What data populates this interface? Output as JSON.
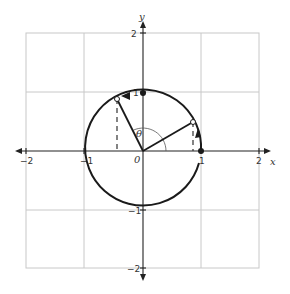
{
  "diagram": {
    "type": "unit-circle",
    "axes": {
      "x_label": "x",
      "y_label": "y",
      "x_ticks": [
        "−2",
        "−1",
        "1",
        "2"
      ],
      "y_ticks": [
        "2",
        "1",
        "−1",
        "−2"
      ],
      "origin_label": "0",
      "range": [
        -2,
        2
      ]
    },
    "angle_label": "θ",
    "circle_radius": 1,
    "points": [
      {
        "name": "point-on-x-axis",
        "x": 1,
        "y": 0,
        "style": "filled"
      },
      {
        "name": "point-on-y-axis",
        "x": 0,
        "y": 1,
        "style": "filled"
      },
      {
        "name": "point-q1",
        "angle_deg": 30,
        "style": "open"
      },
      {
        "name": "point-q2",
        "angle_deg": 115,
        "style": "open"
      }
    ],
    "arrow_directions": "counterclockwise",
    "colors": {
      "curve": "#1a1a1a",
      "grid": "#c8c8c8"
    }
  }
}
